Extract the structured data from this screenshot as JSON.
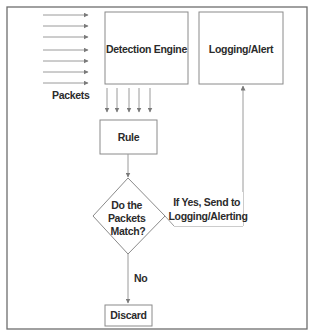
{
  "diagram": {
    "nodes": {
      "detection_engine": "Detection Engine",
      "logging_alert": "Logging/Alert",
      "rule": "Rule",
      "decision": [
        "Do the",
        "Packets",
        "Match?"
      ],
      "discard": "Discard"
    },
    "labels": {
      "packets": "Packets",
      "yes_branch": [
        "If Yes, Send to",
        "Logging/Alerting"
      ],
      "no_branch": "No"
    },
    "edges": [
      {
        "from": "packets",
        "to": "detection_engine",
        "count": 7
      },
      {
        "from": "detection_engine",
        "to": "rule",
        "count": 5
      },
      {
        "from": "rule",
        "to": "decision"
      },
      {
        "from": "decision",
        "to": "logging_alert",
        "label": "If Yes, Send to Logging/Alerting"
      },
      {
        "from": "decision",
        "to": "discard",
        "label": "No"
      }
    ],
    "colors": {
      "background": "#ffffff",
      "stroke": "#8a8a8a",
      "text": "#2b2b2b"
    }
  }
}
